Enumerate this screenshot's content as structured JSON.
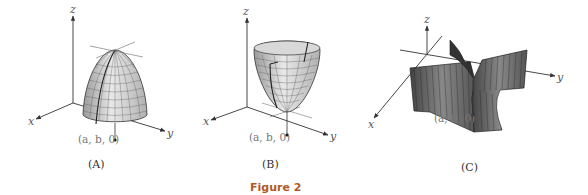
{
  "figure": {
    "title": "Figure 2",
    "title_color": "#b05a2a"
  },
  "panels": [
    {
      "id": "A",
      "caption": "(A)",
      "surface": "downward paraboloid (local maximum)",
      "axes": {
        "x": "x",
        "y": "y",
        "z": "z"
      },
      "point_label": "(a, b, 0)"
    },
    {
      "id": "B",
      "caption": "(B)",
      "surface": "upward paraboloid (local minimum)",
      "axes": {
        "x": "x",
        "y": "y",
        "z": "z"
      },
      "point_label": "(a, b, 0)"
    },
    {
      "id": "C",
      "caption": "(C)",
      "surface": "saddle surface",
      "axes": {
        "x": "x",
        "y": "y",
        "z": "z"
      },
      "point_label": "(a, b, 0)"
    }
  ]
}
